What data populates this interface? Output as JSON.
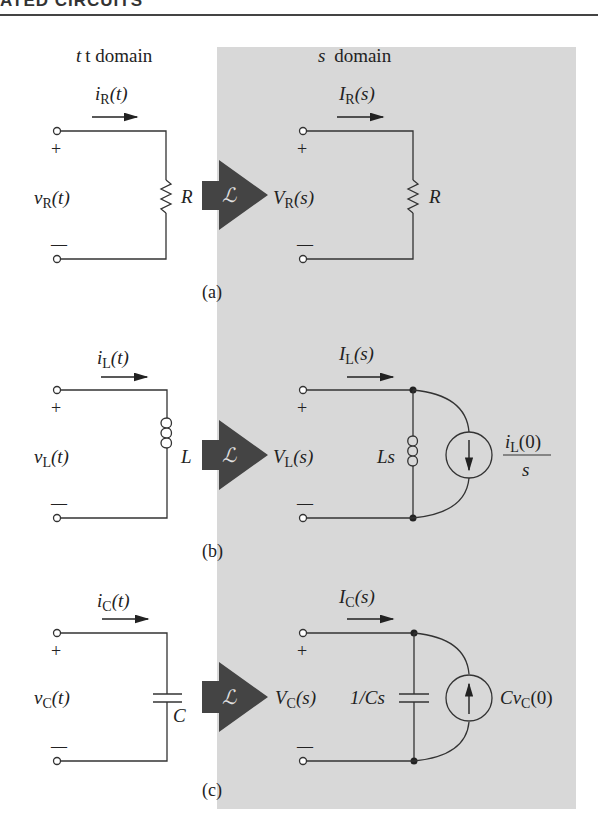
{
  "header": {
    "title": "ATED CIRCUITS"
  },
  "columns": {
    "t_domain": "t domain",
    "s_domain": "s domain"
  },
  "laplace_symbol": "ℒ",
  "colors": {
    "shaded_bg": "#d8d8d8",
    "arrow": "#444444",
    "line": "#333333"
  },
  "panels": [
    {
      "label": "(a)",
      "t": {
        "current": "iR(t)",
        "i_main": "i",
        "i_sub": "R",
        "i_arg": "(t)",
        "voltage_main": "v",
        "voltage_sub": "R",
        "voltage_arg": "(t)",
        "element": "R",
        "element_type": "resistor"
      },
      "s": {
        "current_main": "I",
        "current_sub": "R",
        "current_arg": "(s)",
        "voltage_main": "V",
        "voltage_sub": "R",
        "voltage_arg": "(s)",
        "element": "R"
      },
      "plus": "+",
      "minus": "—"
    },
    {
      "label": "(b)",
      "t": {
        "i_main": "i",
        "i_sub": "L",
        "i_arg": "(t)",
        "voltage_main": "v",
        "voltage_sub": "L",
        "voltage_arg": "(t)",
        "element": "L",
        "element_type": "inductor"
      },
      "s": {
        "current_main": "I",
        "current_sub": "L",
        "current_arg": "(s)",
        "voltage_main": "V",
        "voltage_sub": "L",
        "voltage_arg": "(s)",
        "element": "Ls",
        "source_num_main": "i",
        "source_num_sub": "L",
        "source_num_arg": "(0)",
        "source_den": "s"
      },
      "plus": "+",
      "minus": "—"
    },
    {
      "label": "(c)",
      "t": {
        "i_main": "i",
        "i_sub": "C",
        "i_arg": "(t)",
        "voltage_main": "v",
        "voltage_sub": "C",
        "voltage_arg": "(t)",
        "element": "C",
        "element_type": "capacitor"
      },
      "s": {
        "current_main": "I",
        "current_sub": "C",
        "current_arg": "(s)",
        "voltage_main": "V",
        "voltage_sub": "C",
        "voltage_arg": "(s)",
        "element": "1/Cs",
        "source_pre": "Cv",
        "source_sub": "C",
        "source_arg": "(0)"
      },
      "plus": "+",
      "minus": "—"
    }
  ]
}
